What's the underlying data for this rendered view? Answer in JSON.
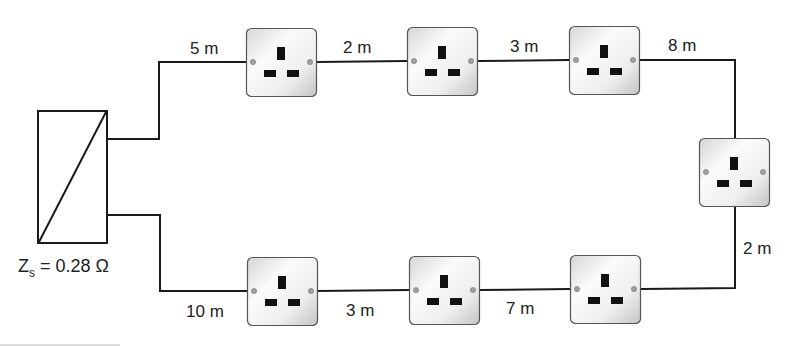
{
  "supply": {
    "label_main": "Z",
    "label_sub": "s",
    "label_value": " = 0.28 Ω",
    "impedance": "0.28 Ω"
  },
  "segments": {
    "top_1": "5 m",
    "top_2": "2 m",
    "top_3": "3 m",
    "top_4": "8 m",
    "right": "2 m",
    "bottom_3": "7 m",
    "bottom_2": "3 m",
    "bottom_1": "10 m"
  },
  "sockets": [
    {
      "id": "top-1",
      "x": 246,
      "y": 28
    },
    {
      "id": "top-2",
      "x": 407,
      "y": 27
    },
    {
      "id": "top-3",
      "x": 569,
      "y": 26
    },
    {
      "id": "right",
      "x": 699,
      "y": 138
    },
    {
      "id": "bottom-3",
      "x": 570,
      "y": 255
    },
    {
      "id": "bottom-2",
      "x": 409,
      "y": 256
    },
    {
      "id": "bottom-1",
      "x": 247,
      "y": 257
    }
  ],
  "colors": {
    "wire": "#1a1a1a",
    "socket_face_light": "#f7f7f7",
    "socket_face_dark": "#cfcfcf",
    "socket_border": "#555555",
    "pin": "#111111",
    "screw": "#9a9a9a"
  }
}
